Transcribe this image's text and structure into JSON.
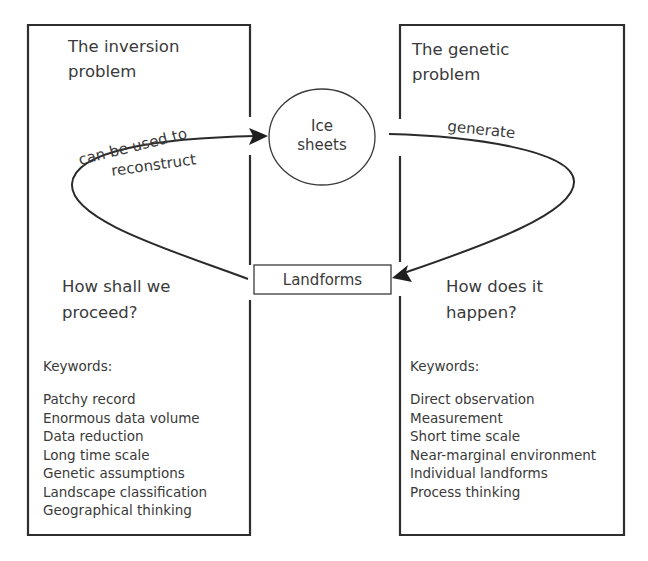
{
  "diagram": {
    "left_panel": {
      "title_lines": [
        "The inversion",
        "problem"
      ],
      "question_lines": [
        "How shall we",
        "proceed?"
      ],
      "keywords_label": "Keywords:",
      "keywords": [
        "Patchy record",
        "Enormous data volume",
        "Data reduction",
        "Long time scale",
        "Genetic assumptions",
        "Landscape classification",
        "Geographical thinking"
      ]
    },
    "right_panel": {
      "title_lines": [
        "The genetic",
        "problem"
      ],
      "question_lines": [
        "How does it",
        "happen?"
      ],
      "keywords_label": "Keywords:",
      "keywords": [
        "Direct observation",
        "Measurement",
        "Short time scale",
        "Near-marginal environment",
        "Individual landforms",
        "Process thinking"
      ]
    },
    "nodes": {
      "ice_sheets": {
        "lines": [
          "Ice",
          "sheets"
        ],
        "shape": "ellipse"
      },
      "landforms": {
        "label": "Landforms",
        "shape": "rectangle"
      }
    },
    "edges": [
      {
        "from": "landforms",
        "to": "ice_sheets",
        "label_lines": [
          "can be used to",
          "reconstruct"
        ],
        "side": "left"
      },
      {
        "from": "ice_sheets",
        "to": "landforms",
        "label": "generate",
        "side": "right"
      }
    ]
  }
}
